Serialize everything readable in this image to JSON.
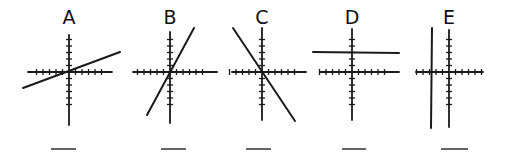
{
  "graphs": [
    {
      "label": "A",
      "line_type": "positive slope (shallow)",
      "slope": 0.37,
      "y_intercept": 0,
      "answer_blank": ""
    },
    {
      "label": "B",
      "line_type": "positive slope (steep)",
      "slope": 1.85,
      "y_intercept": 0,
      "answer_blank": ""
    },
    {
      "label": "C",
      "line_type": "negative slope (steep)",
      "slope": -1.5,
      "y_intercept": 0,
      "answer_blank": ""
    },
    {
      "label": "D",
      "line_type": "horizontal",
      "slope": 0,
      "y_intercept": 3,
      "answer_blank": ""
    },
    {
      "label": "E",
      "line_type": "vertical",
      "slope": null,
      "x_intercept": -3,
      "answer_blank": ""
    }
  ],
  "axis": {
    "ticks_per_side": 5
  }
}
